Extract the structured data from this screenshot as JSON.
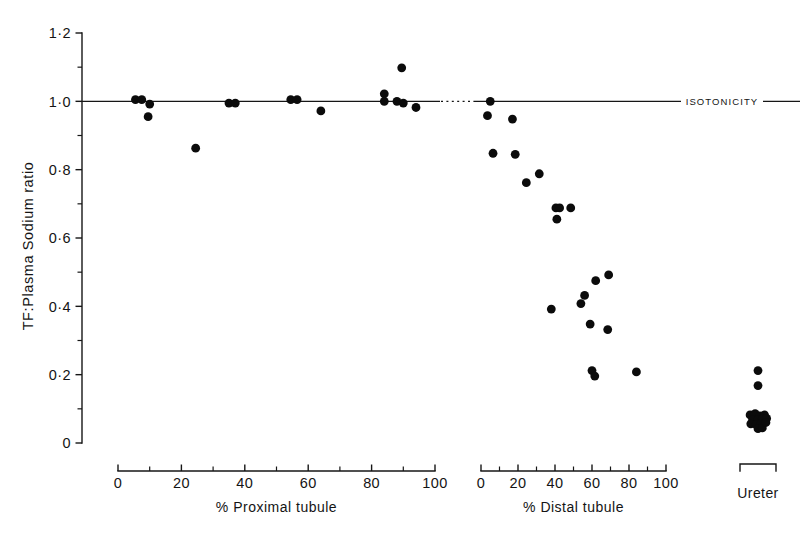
{
  "figure": {
    "name": "tf-plasma-sodium-ratio-scatter",
    "background_color": "#ffffff",
    "ink_color": "#141414",
    "point_color": "#0b0b0b"
  },
  "chart_data": {
    "type": "scatter",
    "title": "",
    "ylabel": "TF:Plasma  Sodium  ratio",
    "ylim": [
      0,
      1.2
    ],
    "y_major_ticks": [
      0,
      0.2,
      0.4,
      0.6,
      0.8,
      1.0,
      1.2
    ],
    "y_major_tick_labels": [
      "0",
      "0·2",
      "0·4",
      "0·6",
      "0·8",
      "1·0",
      "1·2"
    ],
    "y_minor_ticks": [
      0.1,
      0.3,
      0.5,
      0.7,
      0.9,
      1.1
    ],
    "grid": false,
    "legend": false,
    "annotations": [
      {
        "name": "isotonicity-line",
        "text": "ISOTONICITY",
        "y_value": 1.0,
        "style": "horizontal reference line spanning both panels, dotted across the inter-panel gap, label inline at right end"
      }
    ],
    "panels": [
      {
        "name": "proximal-tubule-panel",
        "xlabel": "% Proximal  tubule",
        "xlim": [
          0,
          100
        ],
        "x_major_ticks": [
          0,
          20,
          40,
          60,
          80,
          100
        ],
        "x_major_tick_labels": [
          "0",
          "20",
          "40",
          "60",
          "80",
          "100"
        ],
        "x_minor_ticks": [
          10,
          30,
          50,
          70,
          90
        ],
        "points": [
          {
            "x": 5.5,
            "y": 1.005
          },
          {
            "x": 7.5,
            "y": 1.005
          },
          {
            "x": 10.0,
            "y": 0.992
          },
          {
            "x": 9.5,
            "y": 0.955
          },
          {
            "x": 24.5,
            "y": 0.863
          },
          {
            "x": 35.0,
            "y": 0.995
          },
          {
            "x": 37.0,
            "y": 0.995
          },
          {
            "x": 54.5,
            "y": 1.005
          },
          {
            "x": 56.5,
            "y": 1.005
          },
          {
            "x": 64.0,
            "y": 0.972
          },
          {
            "x": 84.0,
            "y": 1.022
          },
          {
            "x": 84.0,
            "y": 1.0
          },
          {
            "x": 88.0,
            "y": 1.0
          },
          {
            "x": 90.0,
            "y": 0.995
          },
          {
            "x": 89.5,
            "y": 1.098
          },
          {
            "x": 94.0,
            "y": 0.982
          }
        ]
      },
      {
        "name": "distal-tubule-panel",
        "xlabel": "% Distal  tubule",
        "xlim": [
          0,
          100
        ],
        "x_major_ticks": [
          0,
          20,
          40,
          60,
          80,
          100
        ],
        "x_major_tick_labels": [
          "0",
          "20",
          "40",
          "60",
          "80",
          "100"
        ],
        "x_minor_ticks": [
          10,
          30,
          50,
          70,
          90
        ],
        "points": [
          {
            "x": 5.0,
            "y": 1.0
          },
          {
            "x": 3.5,
            "y": 0.958
          },
          {
            "x": 17.0,
            "y": 0.948
          },
          {
            "x": 6.5,
            "y": 0.848
          },
          {
            "x": 18.5,
            "y": 0.845
          },
          {
            "x": 24.5,
            "y": 0.762
          },
          {
            "x": 31.5,
            "y": 0.788
          },
          {
            "x": 40.5,
            "y": 0.688
          },
          {
            "x": 42.5,
            "y": 0.688
          },
          {
            "x": 41.0,
            "y": 0.655
          },
          {
            "x": 48.5,
            "y": 0.688
          },
          {
            "x": 62.0,
            "y": 0.475
          },
          {
            "x": 69.0,
            "y": 0.492
          },
          {
            "x": 56.0,
            "y": 0.432
          },
          {
            "x": 54.0,
            "y": 0.408
          },
          {
            "x": 38.0,
            "y": 0.392
          },
          {
            "x": 59.0,
            "y": 0.348
          },
          {
            "x": 68.5,
            "y": 0.332
          },
          {
            "x": 60.0,
            "y": 0.212
          },
          {
            "x": 61.5,
            "y": 0.196
          },
          {
            "x": 84.0,
            "y": 0.208
          }
        ]
      },
      {
        "name": "ureter-panel",
        "xlabel": "Ureter",
        "bracket": true,
        "points": [
          {
            "x": 0.5,
            "y": 0.212
          },
          {
            "x": 0.5,
            "y": 0.168
          },
          {
            "x": 0.28,
            "y": 0.082
          },
          {
            "x": 0.42,
            "y": 0.086
          },
          {
            "x": 0.55,
            "y": 0.079
          },
          {
            "x": 0.68,
            "y": 0.082
          },
          {
            "x": 0.35,
            "y": 0.068
          },
          {
            "x": 0.5,
            "y": 0.068
          },
          {
            "x": 0.62,
            "y": 0.07
          },
          {
            "x": 0.74,
            "y": 0.072
          },
          {
            "x": 0.3,
            "y": 0.056
          },
          {
            "x": 0.45,
            "y": 0.054
          },
          {
            "x": 0.58,
            "y": 0.056
          },
          {
            "x": 0.5,
            "y": 0.042
          },
          {
            "x": 0.62,
            "y": 0.044
          },
          {
            "x": 0.72,
            "y": 0.06
          }
        ]
      }
    ]
  },
  "geometry": {
    "y_axis_x": 82,
    "y_top_px": 33,
    "y_bottom_px": 443,
    "proximal_axis_y": 471,
    "proximal_x0_px": 118,
    "proximal_x100_px": 435,
    "distal_axis_y": 471,
    "distal_x0_px": 481,
    "distal_x100_px": 666,
    "ureter_bracket_y": 464,
    "ureter_x_left_px": 740,
    "ureter_x_right_px": 776,
    "iso_label_x": 722,
    "point_radius": 4.4
  }
}
